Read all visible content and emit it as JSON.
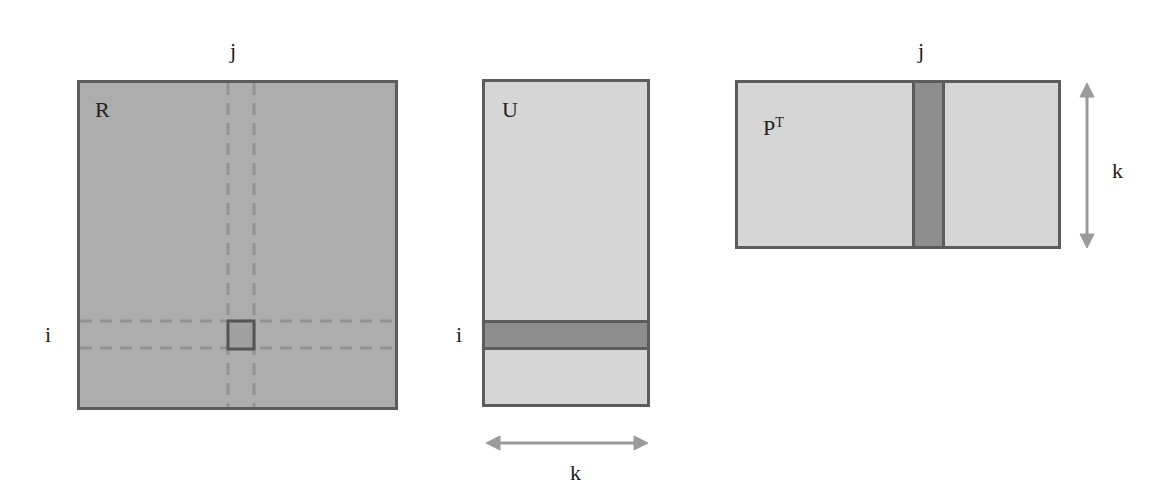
{
  "diagram": {
    "matrices": {
      "R": {
        "label": "R",
        "row_index": "i",
        "col_index": "j",
        "fill": "#adadad"
      },
      "U": {
        "label": "U",
        "row_index": "i",
        "dim_label": "k",
        "fill": "#d6d6d6",
        "highlight": "#8e8e8e"
      },
      "PT": {
        "label": "P",
        "superscript": "T",
        "col_index": "j",
        "dim_label": "k",
        "fill": "#d6d6d6",
        "highlight": "#8e8e8e"
      }
    },
    "colors": {
      "border": "#5c5c5c",
      "dashed": "#939393",
      "arrow": "#9a9a9a"
    }
  }
}
